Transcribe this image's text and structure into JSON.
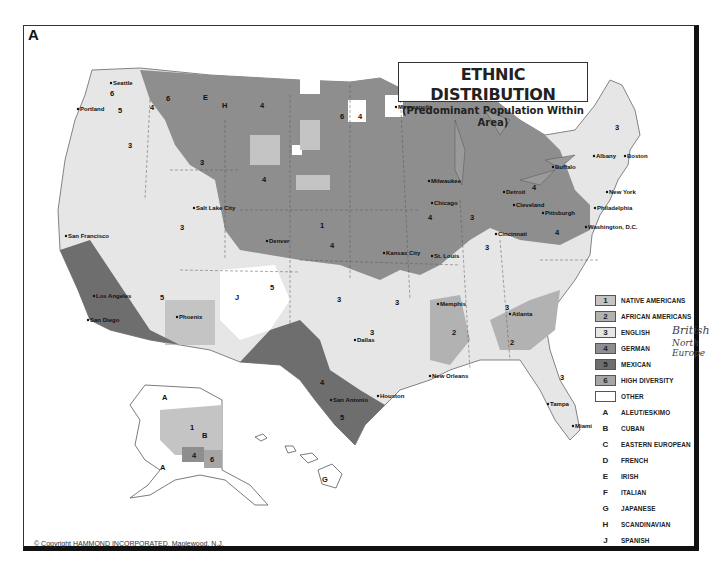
{
  "panel_letter": "A",
  "title": {
    "main": "ETHNIC DISTRIBUTION",
    "sub": "(Predominant Population Within Area)"
  },
  "colors": {
    "native_americans": "#c4c4c4",
    "african_americans": "#b2b2b2",
    "english": "#e6e6e6",
    "german": "#8e8e8e",
    "mexican": "#6e6e6e",
    "high_diversity": "#a6a6a6",
    "other": "#ffffff",
    "frame": "#111111"
  },
  "legend": {
    "numbered": [
      {
        "code": "1",
        "label": "NATIVE AMERICANS",
        "color": "#c4c4c4"
      },
      {
        "code": "2",
        "label": "AFRICAN AMERICANS",
        "color": "#b2b2b2"
      },
      {
        "code": "3",
        "label": "ENGLISH",
        "color": "#e6e6e6"
      },
      {
        "code": "4",
        "label": "GERMAN",
        "color": "#8e8e8e"
      },
      {
        "code": "5",
        "label": "MEXICAN",
        "color": "#6e6e6e"
      },
      {
        "code": "6",
        "label": "HIGH DIVERSITY",
        "color": "#a6a6a6"
      },
      {
        "code": "",
        "label": "OTHER",
        "color": "#ffffff"
      }
    ],
    "lettered": [
      {
        "code": "A",
        "label": "ALEUT/ESKIMO"
      },
      {
        "code": "B",
        "label": "CUBAN"
      },
      {
        "code": "C",
        "label": "EASTERN EUROPEAN"
      },
      {
        "code": "D",
        "label": "FRENCH"
      },
      {
        "code": "E",
        "label": "IRISH"
      },
      {
        "code": "F",
        "label": "ITALIAN"
      },
      {
        "code": "G",
        "label": "JAPANESE"
      },
      {
        "code": "H",
        "label": "SCANDINAVIAN"
      },
      {
        "code": "J",
        "label": "SPANISH"
      }
    ]
  },
  "annotations": {
    "english_note": "British",
    "german_note": "North Europe"
  },
  "cities": [
    {
      "name": "Seattle",
      "x": 113,
      "y": 85
    },
    {
      "name": "Portland",
      "x": 80,
      "y": 111
    },
    {
      "name": "San Francisco",
      "x": 68,
      "y": 238
    },
    {
      "name": "Los Angeles",
      "x": 96,
      "y": 298
    },
    {
      "name": "San Diego",
      "x": 90,
      "y": 322
    },
    {
      "name": "Salt Lake City",
      "x": 196,
      "y": 210
    },
    {
      "name": "Phoenix",
      "x": 179,
      "y": 319
    },
    {
      "name": "Denver",
      "x": 269,
      "y": 243
    },
    {
      "name": "Minneapolis",
      "x": 398,
      "y": 109
    },
    {
      "name": "Milwaukee",
      "x": 431,
      "y": 183
    },
    {
      "name": "Chicago",
      "x": 434,
      "y": 205
    },
    {
      "name": "Detroit",
      "x": 506,
      "y": 194
    },
    {
      "name": "Cleveland",
      "x": 516,
      "y": 207
    },
    {
      "name": "Buffalo",
      "x": 555,
      "y": 169
    },
    {
      "name": "Albany",
      "x": 596,
      "y": 158
    },
    {
      "name": "Boston",
      "x": 627,
      "y": 158
    },
    {
      "name": "New York",
      "x": 609,
      "y": 194
    },
    {
      "name": "Philadelphia",
      "x": 597,
      "y": 210
    },
    {
      "name": "Pittsburgh",
      "x": 545,
      "y": 215
    },
    {
      "name": "Washington, D.C.",
      "x": 588,
      "y": 229
    },
    {
      "name": "Cincinnati",
      "x": 498,
      "y": 236
    },
    {
      "name": "Kansas City",
      "x": 386,
      "y": 255
    },
    {
      "name": "St. Louis",
      "x": 434,
      "y": 258
    },
    {
      "name": "Memphis",
      "x": 440,
      "y": 306
    },
    {
      "name": "Atlanta",
      "x": 512,
      "y": 316
    },
    {
      "name": "Dallas",
      "x": 357,
      "y": 342
    },
    {
      "name": "Houston",
      "x": 380,
      "y": 398
    },
    {
      "name": "San Antonio",
      "x": 333,
      "y": 402
    },
    {
      "name": "New Orleans",
      "x": 432,
      "y": 378
    },
    {
      "name": "Tampa",
      "x": 550,
      "y": 406
    },
    {
      "name": "Miami",
      "x": 575,
      "y": 428
    }
  ],
  "copyright": "© Copyright  HAMMOND INCORPORATED, Maplewood, N.J."
}
